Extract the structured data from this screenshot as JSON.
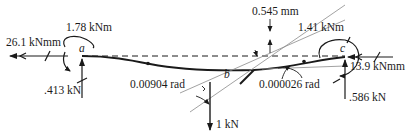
{
  "diagram": {
    "points": {
      "a": "a",
      "b": "b",
      "c": "c"
    },
    "labels": {
      "moment_a": "1.78 kNm",
      "axial_a": "26.1 kNmm",
      "reaction_a": ".413 kN",
      "rotation_ab": "0.00904 rad",
      "load_b": "1 kN",
      "deflection": "0.545 mm",
      "moment_c": "1.41 kNm",
      "axial_c": "13.9 kNmm",
      "rotation_c": "0.000026 rad",
      "reaction_c": ".586 kN"
    },
    "colors": {
      "line": "#1a1a1a",
      "construction": "#8a8a8a"
    }
  }
}
